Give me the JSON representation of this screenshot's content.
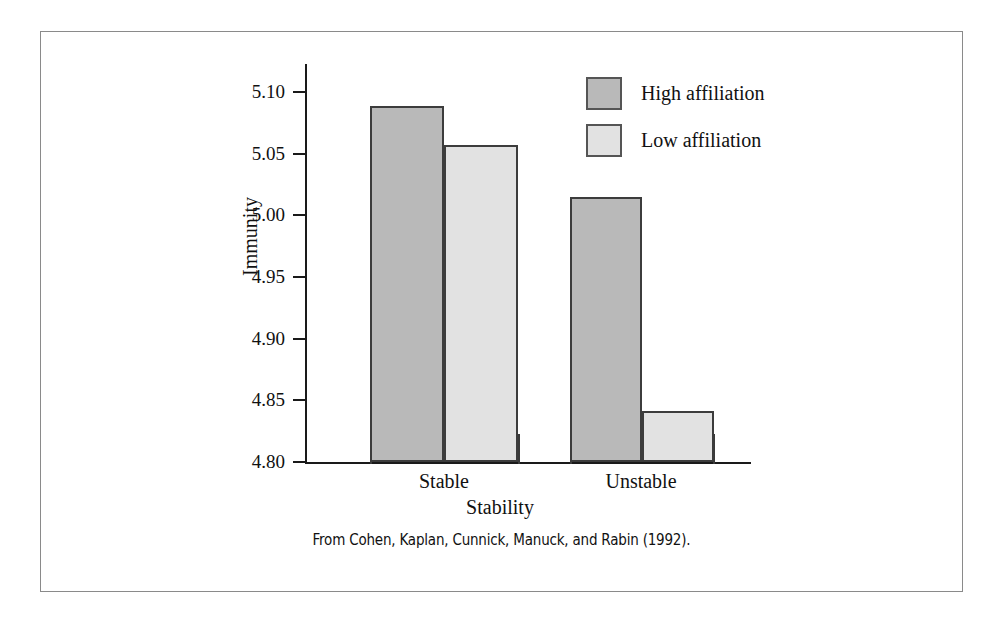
{
  "figure": {
    "caption": "From Cohen, Kaplan, Cunnick, Manuck, and Rabin (1992).",
    "frame_color": "#8a8a8a",
    "background": "#ffffff"
  },
  "chart_data": {
    "type": "bar",
    "title": "",
    "xlabel": "Stability",
    "ylabel": "Immunity",
    "categories": [
      "Stable",
      "Unstable"
    ],
    "series": [
      {
        "name": "High affiliation",
        "values": [
          5.089,
          5.015
        ],
        "color": "#b9b9b9"
      },
      {
        "name": "Low affiliation",
        "values": [
          5.057,
          4.841
        ],
        "color": "#e2e2e2"
      }
    ],
    "ylim": [
      4.8,
      5.1
    ],
    "ytick_labels": [
      "5.10",
      "5.05",
      "5.00",
      "4.95",
      "4.90",
      "4.85",
      "4.80"
    ],
    "ytick_values": [
      5.1,
      5.05,
      5.0,
      4.95,
      4.9,
      4.85,
      4.8
    ],
    "grid": false,
    "legend_position": "top-right",
    "legend_entries": [
      "High affiliation",
      "Low affiliation"
    ],
    "bar_border_color": "#3c3c3c",
    "axis_color": "#1a1a1a"
  }
}
